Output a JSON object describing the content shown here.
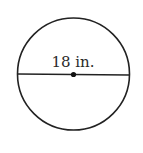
{
  "figure": {
    "type": "circle-diameter",
    "diameter_label": "18 in.",
    "colors": {
      "stroke": "#222222",
      "background": "#ffffff"
    }
  }
}
